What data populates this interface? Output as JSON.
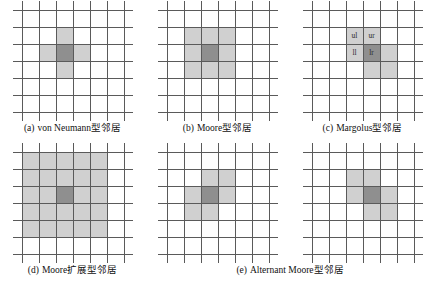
{
  "figure": {
    "grid": {
      "columns": 6,
      "rows": 6,
      "cell_px": 17,
      "line_color": "#5a5a5a",
      "neighbor_color": "#d0d0d0",
      "center_color": "#8f8f8f",
      "background": "#ffffff"
    },
    "panels": [
      {
        "id": "von-neumann",
        "caption_index": "(a)",
        "caption_text": "von Neumann型邻居",
        "has_caption": true,
        "center": [
          2,
          2
        ],
        "neighbors": [
          [
            2,
            1
          ],
          [
            1,
            2
          ],
          [
            3,
            2
          ],
          [
            2,
            3
          ]
        ],
        "labels": []
      },
      {
        "id": "moore",
        "caption_index": "(b)",
        "caption_text": "Moore型邻居",
        "has_caption": true,
        "center": [
          2,
          2
        ],
        "neighbors": [
          [
            1,
            1
          ],
          [
            2,
            1
          ],
          [
            3,
            1
          ],
          [
            1,
            2
          ],
          [
            3,
            2
          ],
          [
            1,
            3
          ],
          [
            2,
            3
          ],
          [
            3,
            3
          ]
        ],
        "labels": []
      },
      {
        "id": "margolus",
        "caption_index": "(c)",
        "caption_text": "Margolus型邻居",
        "has_caption": true,
        "center": [
          3,
          2
        ],
        "neighbors": [
          [
            2,
            1
          ],
          [
            3,
            1
          ],
          [
            2,
            2
          ],
          [
            4,
            2
          ],
          [
            3,
            3
          ],
          [
            4,
            3
          ]
        ],
        "labels": [
          {
            "col": 2,
            "row": 1,
            "text": "ul"
          },
          {
            "col": 3,
            "row": 1,
            "text": "ur"
          },
          {
            "col": 2,
            "row": 2,
            "text": "ll"
          },
          {
            "col": 3,
            "row": 2,
            "text": "lr"
          }
        ]
      },
      {
        "id": "moore-extended",
        "caption_index": "(d)",
        "caption_text": "Moore扩展型邻居",
        "has_caption": true,
        "center": [
          2,
          2
        ],
        "neighbors": [
          [
            0,
            0
          ],
          [
            1,
            0
          ],
          [
            2,
            0
          ],
          [
            3,
            0
          ],
          [
            4,
            0
          ],
          [
            0,
            1
          ],
          [
            1,
            1
          ],
          [
            2,
            1
          ],
          [
            3,
            1
          ],
          [
            4,
            1
          ],
          [
            0,
            2
          ],
          [
            1,
            2
          ],
          [
            3,
            2
          ],
          [
            4,
            2
          ],
          [
            0,
            3
          ],
          [
            1,
            3
          ],
          [
            2,
            3
          ],
          [
            3,
            3
          ],
          [
            4,
            3
          ],
          [
            0,
            4
          ],
          [
            1,
            4
          ],
          [
            2,
            4
          ],
          [
            3,
            4
          ],
          [
            4,
            4
          ]
        ],
        "labels": []
      },
      {
        "id": "alternant-moore-1",
        "caption_index": "(e)",
        "caption_text": "Alternant Moore型邻居",
        "has_caption": true,
        "center": [
          2,
          2
        ],
        "neighbors": [
          [
            2,
            1
          ],
          [
            3,
            1
          ],
          [
            1,
            2
          ],
          [
            3,
            2
          ],
          [
            1,
            3
          ],
          [
            2,
            3
          ]
        ],
        "labels": []
      },
      {
        "id": "alternant-moore-2",
        "caption_index": "",
        "caption_text": "",
        "has_caption": false,
        "center": [
          3,
          2
        ],
        "neighbors": [
          [
            2,
            1
          ],
          [
            3,
            1
          ],
          [
            2,
            2
          ],
          [
            4,
            2
          ],
          [
            3,
            3
          ],
          [
            4,
            3
          ]
        ],
        "labels": []
      }
    ]
  }
}
